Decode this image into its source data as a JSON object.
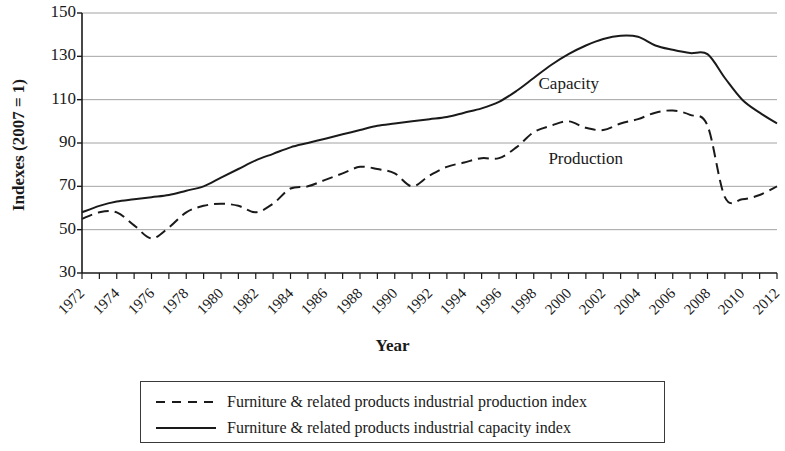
{
  "chart_data": {
    "type": "line",
    "title": "",
    "xlabel": "Year",
    "ylabel": "Indexes (2007 = 1)",
    "xlim": [
      1972,
      2012
    ],
    "ylim": [
      30,
      150
    ],
    "yticks": [
      30,
      50,
      70,
      90,
      110,
      130,
      150
    ],
    "xticks": [
      1972,
      1974,
      1976,
      1978,
      1980,
      1982,
      1984,
      1986,
      1988,
      1990,
      1992,
      1994,
      1996,
      1998,
      2000,
      2002,
      2004,
      2006,
      2008,
      2010,
      2012
    ],
    "grid": "horizontal",
    "legend_position": "below",
    "x": [
      1972,
      1973,
      1974,
      1975,
      1976,
      1977,
      1978,
      1979,
      1980,
      1981,
      1982,
      1983,
      1984,
      1985,
      1986,
      1987,
      1988,
      1989,
      1990,
      1991,
      1992,
      1993,
      1994,
      1995,
      1996,
      1997,
      1998,
      1999,
      2000,
      2001,
      2002,
      2003,
      2004,
      2005,
      2006,
      2007,
      2008,
      2009,
      2010,
      2011,
      2012
    ],
    "series": [
      {
        "name": "Furniture & related products industrial capacity index",
        "style": "solid",
        "color": "#1a1a1a",
        "values": [
          58,
          61,
          63,
          64,
          65,
          66,
          68,
          70,
          74,
          78,
          82,
          85,
          88,
          90,
          92,
          94,
          96,
          98,
          99,
          100,
          101,
          102,
          104,
          106,
          109,
          114,
          120,
          126,
          131,
          135,
          138,
          139.5,
          139,
          135,
          133,
          131.5,
          131,
          120,
          110,
          104,
          99
        ]
      },
      {
        "name": "Furniture & related products industrial production index",
        "style": "dashed",
        "color": "#1a1a1a",
        "values": [
          55,
          58,
          58,
          52,
          46,
          51,
          58,
          61,
          62,
          61,
          58,
          62,
          69,
          70,
          73,
          76,
          79,
          78,
          76,
          70,
          75,
          79,
          81,
          83,
          83,
          88,
          95,
          98,
          100,
          97,
          96,
          99,
          101,
          104,
          105,
          103,
          98,
          65,
          64,
          66,
          70
        ]
      }
    ],
    "annotations": [
      {
        "text": "Capacity",
        "x": 2000,
        "y": 117
      },
      {
        "text": "Production",
        "x": 2001,
        "y": 82
      }
    ]
  },
  "legend": {
    "items": [
      {
        "label": "Furniture & related products industrial production index",
        "style": "dashed"
      },
      {
        "label": "Furniture & related products industrial capacity index",
        "style": "solid"
      }
    ]
  }
}
